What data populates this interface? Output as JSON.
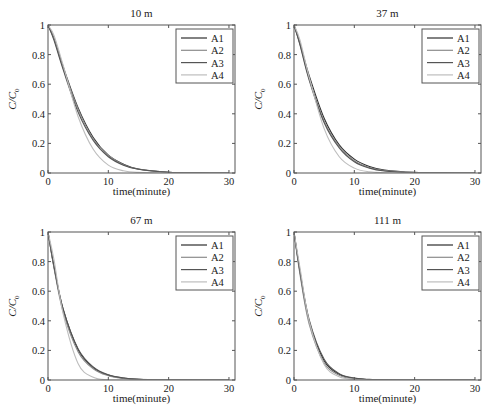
{
  "figure": {
    "panels": [
      {
        "id": "p10",
        "title": "10 m"
      },
      {
        "id": "p37",
        "title": "37 m"
      },
      {
        "id": "p67",
        "title": "67 m"
      },
      {
        "id": "p111",
        "title": "111 m"
      }
    ],
    "xlabel": "time(minute)",
    "ylabel_main": "C/C",
    "ylabel_sub": "0",
    "legend": [
      "A1",
      "A2",
      "A3",
      "A4"
    ],
    "series_colors": {
      "A1": "#2e2e2e",
      "A2": "#8c8c8c",
      "A3": "#555555",
      "A4": "#bdbdbd"
    },
    "frame_color": "#555555"
  },
  "chart_data": [
    {
      "type": "line",
      "title": "10 m",
      "xlabel": "time(minute)",
      "ylabel": "C/C0",
      "xlim": [
        0,
        31
      ],
      "ylim": [
        0,
        1
      ],
      "xticks": [
        0,
        10,
        20,
        30
      ],
      "yticks": [
        0,
        0.2,
        0.4,
        0.6,
        0.8,
        1
      ],
      "grid": false,
      "legend_position": "upper right",
      "x": [
        0,
        1,
        2.5,
        5,
        7.5,
        10,
        12.5,
        15,
        20,
        25,
        30
      ],
      "series": [
        {
          "name": "A1",
          "values": [
            1,
            0.91,
            0.72,
            0.44,
            0.24,
            0.12,
            0.06,
            0.027,
            0.005,
            0.001,
            0
          ]
        },
        {
          "name": "A2",
          "values": [
            1,
            0.905,
            0.71,
            0.43,
            0.23,
            0.12,
            0.056,
            0.025,
            0.005,
            0.001,
            0
          ]
        },
        {
          "name": "A3",
          "values": [
            1,
            0.896,
            0.7,
            0.41,
            0.22,
            0.11,
            0.053,
            0.025,
            0.004,
            0.001,
            0
          ]
        },
        {
          "name": "A4",
          "values": [
            1,
            0.929,
            0.73,
            0.38,
            0.16,
            0.053,
            0.015,
            0.004,
            0,
            0,
            0
          ]
        }
      ]
    },
    {
      "type": "line",
      "title": "37 m",
      "xlabel": "time(minute)",
      "ylabel": "C/C0",
      "xlim": [
        0,
        31
      ],
      "ylim": [
        0,
        1
      ],
      "xticks": [
        0,
        10,
        20,
        30
      ],
      "yticks": [
        0,
        0.2,
        0.4,
        0.6,
        0.8,
        1
      ],
      "grid": false,
      "legend_position": "upper right",
      "x": [
        0,
        1,
        2.5,
        5,
        7.5,
        10,
        12.5,
        15,
        20,
        25,
        30
      ],
      "series": [
        {
          "name": "A1",
          "values": [
            1,
            0.875,
            0.66,
            0.37,
            0.19,
            0.094,
            0.044,
            0.02,
            0.004,
            0.001,
            0
          ]
        },
        {
          "name": "A2",
          "values": [
            1,
            0.869,
            0.64,
            0.35,
            0.18,
            0.083,
            0.037,
            0.016,
            0.003,
            0,
            0
          ]
        },
        {
          "name": "A3",
          "values": [
            1,
            0.865,
            0.63,
            0.34,
            0.17,
            0.076,
            0.033,
            0.014,
            0.002,
            0,
            0
          ]
        },
        {
          "name": "A4",
          "values": [
            1,
            0.898,
            0.65,
            0.3,
            0.11,
            0.033,
            0.008,
            0.002,
            0,
            0,
            0
          ]
        }
      ]
    },
    {
      "type": "line",
      "title": "67 m",
      "xlabel": "time(minute)",
      "ylabel": "C/C0",
      "xlim": [
        0,
        31
      ],
      "ylim": [
        0,
        1
      ],
      "xticks": [
        0,
        10,
        20,
        30
      ],
      "yticks": [
        0,
        0.2,
        0.4,
        0.6,
        0.8,
        1
      ],
      "grid": false,
      "legend_position": "upper right",
      "x": [
        0,
        1,
        2.5,
        5,
        7.5,
        10,
        12.5,
        15,
        20,
        25,
        30
      ],
      "series": [
        {
          "name": "A1",
          "values": [
            1,
            0.763,
            0.48,
            0.205,
            0.084,
            0.033,
            0.013,
            0.005,
            0.001,
            0,
            0
          ]
        },
        {
          "name": "A2",
          "values": [
            1,
            0.756,
            0.46,
            0.19,
            0.076,
            0.029,
            0.011,
            0.004,
            0.001,
            0,
            0
          ]
        },
        {
          "name": "A3",
          "values": [
            1,
            0.767,
            0.48,
            0.21,
            0.088,
            0.035,
            0.014,
            0.005,
            0.001,
            0,
            0
          ]
        },
        {
          "name": "A4",
          "values": [
            1,
            0.812,
            0.45,
            0.11,
            0.018,
            0.002,
            0,
            0,
            0,
            0,
            0
          ]
        }
      ]
    },
    {
      "type": "line",
      "title": "111 m",
      "xlabel": "time(minute)",
      "ylabel": "C/C0",
      "xlim": [
        0,
        31
      ],
      "ylim": [
        0,
        1
      ],
      "xticks": [
        0,
        10,
        20,
        30
      ],
      "yticks": [
        0,
        0.2,
        0.4,
        0.6,
        0.8,
        1
      ],
      "grid": false,
      "legend_position": "upper right",
      "x": [
        0,
        1,
        2.5,
        5,
        7.5,
        10,
        12.5,
        15,
        20,
        25,
        30
      ],
      "series": [
        {
          "name": "A1",
          "values": [
            1,
            0.727,
            0.4,
            0.13,
            0.039,
            0.011,
            0.003,
            0.001,
            0,
            0,
            0
          ]
        },
        {
          "name": "A2",
          "values": [
            1,
            0.712,
            0.38,
            0.115,
            0.032,
            0.008,
            0.002,
            0,
            0,
            0,
            0
          ]
        },
        {
          "name": "A3",
          "values": [
            1,
            0.733,
            0.41,
            0.14,
            0.043,
            0.013,
            0.004,
            0.001,
            0,
            0,
            0
          ]
        },
        {
          "name": "A4",
          "values": [
            1,
            0.757,
            0.4,
            0.105,
            0.022,
            0.004,
            0,
            0,
            0,
            0,
            0
          ]
        }
      ]
    }
  ]
}
